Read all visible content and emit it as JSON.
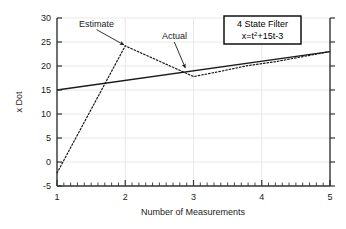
{
  "chart_data": {
    "type": "line",
    "title": "",
    "xlabel": "Number of Measurements",
    "ylabel": "x Dot",
    "xlim": [
      1,
      5
    ],
    "ylim": [
      -5,
      30
    ],
    "xticks": [
      1,
      2,
      3,
      4,
      5
    ],
    "yticks": [
      -5,
      0,
      5,
      10,
      15,
      20,
      25,
      30
    ],
    "xtick_labels": [
      "1",
      "2",
      "3",
      "4",
      "5"
    ],
    "ytick_labels": [
      "-5",
      "0",
      "5",
      "10",
      "15",
      "20",
      "25",
      "30"
    ],
    "grid": true,
    "grid_color": "#e8e8e8",
    "legend_position": "top-right",
    "minor_ticks_x": 40,
    "series": [
      {
        "name": "Actual",
        "style": "solid",
        "color": "#1a1a1a",
        "x": [
          1,
          5
        ],
        "values": [
          15.0,
          23.0
        ]
      },
      {
        "name": "Estimate",
        "style": "dotted",
        "color": "#1a1a1a",
        "x": [
          1,
          2,
          3,
          3.4,
          3.8,
          4.2,
          5
        ],
        "values": [
          -2.3,
          24.2,
          17.8,
          18.9,
          20.1,
          20.9,
          23.0
        ]
      }
    ],
    "annotations": [
      {
        "label": "Estimate",
        "label_x": 1.58,
        "label_y": 28.2,
        "point_x": 1.98,
        "point_y": 24.4
      },
      {
        "label": "Actual",
        "label_x": 2.72,
        "label_y": 25.6,
        "point_x": 2.88,
        "point_y": 19.6
      }
    ],
    "legend": {
      "line1": "4 State Filter",
      "line2_prefix": "x=t",
      "line2_exponent": "2",
      "line2_suffix": "+15t-3"
    }
  }
}
